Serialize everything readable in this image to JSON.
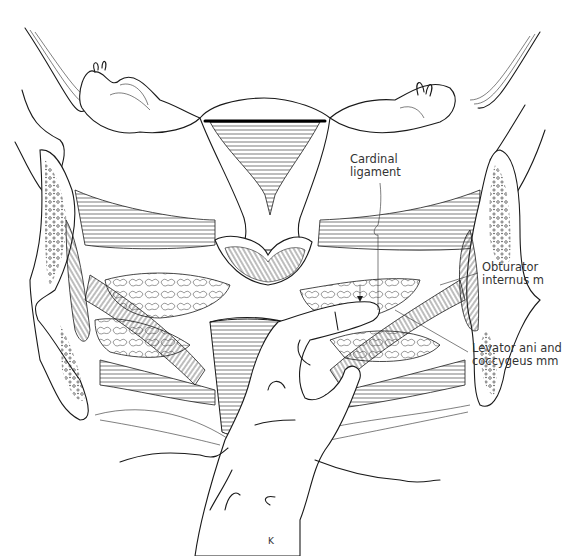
{
  "figure": {
    "type": "anatomical line illustration",
    "labels": [
      {
        "id": "cardinal-ligament",
        "line1": "Cardinal",
        "line2": "ligament",
        "x": 350,
        "y": 153
      },
      {
        "id": "obturator-internus",
        "line1": "Obturator",
        "line2": "internus m",
        "x": 482,
        "y": 261
      },
      {
        "id": "levator-ani",
        "line1": "Levator ani and",
        "line2": "coccygeus mm",
        "x": 472,
        "y": 342
      }
    ],
    "artist_mark": "K"
  },
  "colors": {
    "ink": "#1a1a1a",
    "paper": "#ffffff",
    "label": "#333333"
  }
}
